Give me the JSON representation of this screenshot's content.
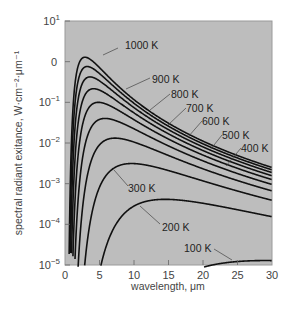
{
  "chart_data": {
    "type": "line",
    "title": "",
    "xlabel": "wavelength, μm",
    "ylabel": "spectral radiant exitance, W·cm⁻²·μm⁻¹",
    "xlim": [
      0,
      30
    ],
    "ylim_log10": [
      -5,
      1
    ],
    "yscale": "log",
    "grid": false,
    "legend": "inline labels",
    "x_ticks": [
      "0",
      "5",
      "10",
      "15",
      "20",
      "25",
      "30"
    ],
    "y_ticks": [
      {
        "base": "10",
        "exp": "1"
      },
      {
        "base": "0",
        "exp": ""
      },
      {
        "base": "10",
        "exp": "−1"
      },
      {
        "base": "10",
        "exp": "−2"
      },
      {
        "base": "10",
        "exp": "−3"
      },
      {
        "base": "10",
        "exp": "−4"
      },
      {
        "base": "10",
        "exp": "−5"
      }
    ],
    "series": [
      {
        "name": "1000 K",
        "T": 1000,
        "peak_x": 2.9,
        "peak_y": 1.29,
        "label": {
          "x": 125,
          "y": 45,
          "lx": 103,
          "ly": 55,
          "tx": 118,
          "ty": 48
        }
      },
      {
        "name": "900 K",
        "T": 900,
        "peak_x": 3.2,
        "peak_y": 0.76,
        "label": {
          "x": 152,
          "y": 79,
          "lx": 126,
          "ly": 89,
          "tx": 150,
          "ty": 78
        }
      },
      {
        "name": "800 K",
        "T": 800,
        "peak_x": 3.6,
        "peak_y": 0.42,
        "label": {
          "x": 171,
          "y": 94,
          "lx": 150,
          "ly": 110,
          "tx": 170,
          "ty": 94
        }
      },
      {
        "name": "700 K",
        "T": 700,
        "peak_x": 4.1,
        "peak_y": 0.21,
        "label": {
          "x": 186,
          "y": 108,
          "lx": 168,
          "ly": 125,
          "tx": 186,
          "ty": 108
        }
      },
      {
        "name": "600 K",
        "T": 600,
        "peak_x": 4.8,
        "peak_y": 0.096,
        "label": {
          "x": 202,
          "y": 121,
          "lx": 188,
          "ly": 137,
          "tx": 202,
          "ty": 121
        }
      },
      {
        "name": "500 K",
        "T": 500,
        "peak_x": 5.8,
        "peak_y": 0.038,
        "label": {
          "x": 222,
          "y": 135,
          "lx": 210,
          "ly": 150,
          "tx": 222,
          "ty": 135
        }
      },
      {
        "name": "400 K",
        "T": 400,
        "peak_x": 7.2,
        "peak_y": 0.0128,
        "label": {
          "x": 241,
          "y": 148,
          "lx": 226,
          "ly": 166,
          "tx": 241,
          "ty": 148
        }
      },
      {
        "name": "300 K",
        "T": 300,
        "peak_x": 9.7,
        "peak_y": 0.00313,
        "label": {
          "x": 128,
          "y": 188,
          "lx": 114,
          "ly": 170,
          "tx": 128,
          "ty": 186
        }
      },
      {
        "name": "200 K",
        "T": 200,
        "peak_x": 14.5,
        "peak_y": 0.00041,
        "label": {
          "x": 162,
          "y": 227,
          "lx": 140,
          "ly": 206,
          "tx": 160,
          "ty": 224
        }
      },
      {
        "name": "100 K",
        "T": 100,
        "peak_x": 29.0,
        "peak_y": 1.29e-05,
        "label": {
          "x": 184,
          "y": 248,
          "lx": 232,
          "ly": 260,
          "tx": 214,
          "ty": 249
        }
      }
    ],
    "planck_constants": {
      "C1_W_um4_per_cm2": 37418,
      "C2_um_K": 14388
    }
  },
  "colors": {
    "plot_background": "#bdbdbd",
    "curve": "#111111",
    "frame": "#9a9a9a",
    "tick": "#666666"
  },
  "layout": {
    "plot_left": 65,
    "plot_top": 21,
    "plot_right": 272,
    "plot_bottom": 265
  }
}
